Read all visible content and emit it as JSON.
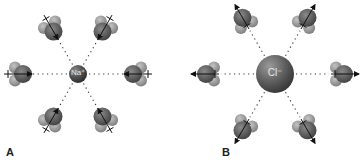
{
  "figure": {
    "panels": [
      {
        "id": "A",
        "label": "A",
        "ion": {
          "symbol": "Na⁺",
          "charge": "positive",
          "radius": 9,
          "cx": 78,
          "cy": 74
        },
        "water_orientation": "oxygen toward ion (dipole arrows point inward)",
        "waters": [
          {
            "position": "upper-left",
            "angle_deg": -120
          },
          {
            "position": "upper-right",
            "angle_deg": -60
          },
          {
            "position": "left",
            "angle_deg": 180
          },
          {
            "position": "right",
            "angle_deg": 0
          },
          {
            "position": "lower-left",
            "angle_deg": 120
          },
          {
            "position": "lower-right",
            "angle_deg": 60
          }
        ]
      },
      {
        "id": "B",
        "label": "B",
        "ion": {
          "symbol": "Cl⁻",
          "charge": "negative",
          "radius": 19,
          "cx": 275,
          "cy": 74
        },
        "water_orientation": "hydrogens toward ion (dipole arrows point outward)",
        "waters": [
          {
            "position": "upper-left",
            "angle_deg": -120
          },
          {
            "position": "upper-right",
            "angle_deg": -60
          },
          {
            "position": "left",
            "angle_deg": 180
          },
          {
            "position": "right",
            "angle_deg": 0
          },
          {
            "position": "lower-left",
            "angle_deg": 120
          },
          {
            "position": "lower-right",
            "angle_deg": 60
          }
        ]
      }
    ],
    "colors": {
      "ion_dark": "#3a3a3a",
      "ion_light": "#8a8a8a",
      "oxygen": "#5a5a5a",
      "hydrogen": "#9a9a9a",
      "arrow": "#111111",
      "dotted_line": "#333333"
    }
  }
}
